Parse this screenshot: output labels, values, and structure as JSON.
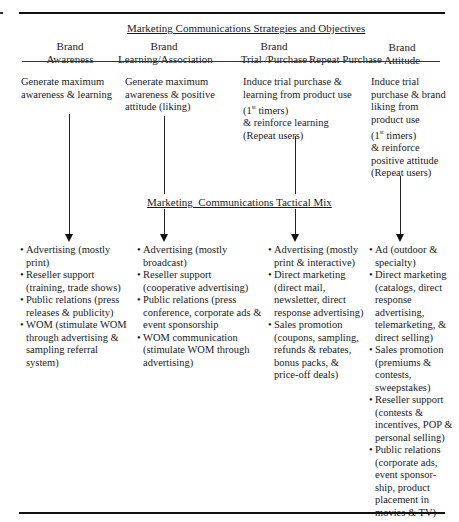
{
  "title_top": "Marketing Communications Strategies and Objectives",
  "title_mid": "Marketing  Communications Tactical Mix",
  "headers": [
    {
      "line1": "Brand",
      "line2": "Awareness"
    },
    {
      "line1": "Brand",
      "line2": "Learning/Association"
    },
    {
      "line1": "Brand",
      "line2": "Trial /Purchase"
    },
    {
      "line1": "",
      "line2": "Repeat Purchase"
    },
    {
      "line1": "Brand",
      "line2": "Attitude"
    }
  ],
  "objectives": [
    {
      "lines": [
        "Generate maximum",
        "awareness & learning"
      ]
    },
    {
      "lines": [
        "Generate maximum",
        "awareness & positive",
        "attitude (liking)"
      ]
    },
    {
      "lines": [
        "Induce trial purchase &",
        "learning from product use",
        " (1",
        "st",
        " timers)",
        "& reinforce learning",
        " (Repeat users)"
      ]
    },
    {
      "lines": [
        "Induce trial",
        "purchase & brand",
        "liking from",
        "product use",
        "(1",
        "st",
        " timers)",
        "& reinforce",
        "positive attitude",
        "(Repeat users)"
      ]
    }
  ],
  "tactics": [
    {
      "items": [
        "Advertising (mostly print)",
        "Reseller support (training, trade shows)",
        "Public relations (press releases & publicity)",
        "WOM (stimulate WOM through advertising & sampling referral system)"
      ]
    },
    {
      "items": [
        "Advertising (mostly broadcast)",
        "Reseller support (cooperative advertising)",
        "Public relations (press conference, corporate ads & event sponsorship",
        "WOM communication (stimulate WOM through advertising)"
      ]
    },
    {
      "items": [
        "Advertising (mostly print & interactive)",
        "Direct marketing (direct mail, newsletter, direct response advertising)",
        "Sales promotion (coupons, sampling, refunds & rebates, bonus packs, & price-off deals)"
      ]
    },
    {
      "items": [
        "Ad (outdoor & specialty)",
        "Direct marketing (catalogs, direct response advertising, telemarketing, & direct selling)",
        "Sales promotion (premiums & contests, sweepstakes)",
        "Reseller support (contests & incentives, POP & personal selling)",
        "Public relations (corporate ads, event sponsor-ship, product placement in movies & TV)"
      ]
    }
  ],
  "bullet": "•"
}
